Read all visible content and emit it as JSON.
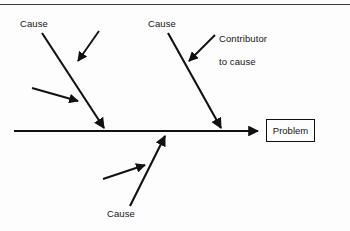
{
  "diagram": {
    "type": "fishbone-cause-and-effect",
    "title_rule": "top-horizontal-rule",
    "colors": {
      "stroke": "#111111",
      "background": "#fdfdfd",
      "rule": "#3a3a42",
      "text": "#151515"
    },
    "spine": {
      "name": "main-spine-arrow",
      "x1": 14,
      "y1": 131,
      "x2": 264,
      "y2": 131,
      "arrowhead": "right"
    },
    "problem": {
      "label": "Problem",
      "box": {
        "x": 266,
        "y": 119,
        "width": 49,
        "height": 23
      }
    },
    "bones": [
      {
        "id": "bone-upper-left",
        "label": "Cause",
        "label_x": 20,
        "label_y": 19,
        "line": {
          "x1": 42,
          "y1": 33,
          "x2": 106,
          "y2": 132
        },
        "arrowhead": "end"
      },
      {
        "id": "bone-upper-right",
        "label": "Cause",
        "label_x": 148,
        "label_y": 19,
        "line": {
          "x1": 168,
          "y1": 33,
          "x2": 223,
          "y2": 132
        },
        "arrowhead": "end"
      },
      {
        "id": "bone-lower-center",
        "label": "Cause",
        "label_x": 107,
        "label_y": 209,
        "line": {
          "x1": 130,
          "y1": 206,
          "x2": 164,
          "y2": 132
        },
        "arrowhead": "end"
      }
    ],
    "contributors": [
      {
        "id": "contributor-upper-left-a",
        "label": null,
        "line": {
          "x1": 99,
          "y1": 31,
          "x2": 76,
          "y2": 64
        },
        "arrowhead": "end"
      },
      {
        "id": "contributor-upper-left-b",
        "label": null,
        "line": {
          "x1": 32,
          "y1": 88,
          "x2": 81,
          "y2": 102
        },
        "arrowhead": "end"
      },
      {
        "id": "contributor-upper-right",
        "label_line1": "Contributor",
        "label_line2": "to cause",
        "label_x": 208,
        "label_y": 22,
        "line": {
          "x1": 215,
          "y1": 35,
          "x2": 187,
          "y2": 64
        },
        "arrowhead": "end"
      },
      {
        "id": "contributor-lower-center",
        "label": null,
        "line": {
          "x1": 103,
          "y1": 179,
          "x2": 148,
          "y2": 164
        },
        "arrowhead": "end"
      }
    ]
  }
}
